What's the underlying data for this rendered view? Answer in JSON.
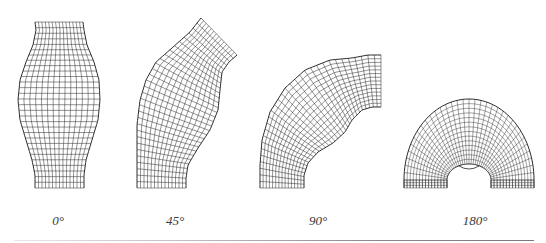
{
  "figure": {
    "stroke_color": "#2a2a2a",
    "panels": [
      {
        "id": "angle-0",
        "label": "0°",
        "label_x": 58,
        "type": "straight",
        "rows": 30,
        "cols": 14,
        "left": [
          [
            35,
            22
          ],
          [
            36,
            30
          ],
          [
            33,
            45
          ],
          [
            26,
            62
          ],
          [
            20,
            80
          ],
          [
            18,
            100
          ],
          [
            20,
            120
          ],
          [
            26,
            140
          ],
          [
            32,
            160
          ],
          [
            35,
            175
          ],
          [
            35,
            188
          ]
        ],
        "right": [
          [
            83,
            22
          ],
          [
            84,
            30
          ],
          [
            87,
            45
          ],
          [
            94,
            62
          ],
          [
            99,
            80
          ],
          [
            100,
            100
          ],
          [
            98,
            120
          ],
          [
            92,
            140
          ],
          [
            86,
            160
          ],
          [
            84,
            175
          ],
          [
            84,
            188
          ]
        ]
      },
      {
        "id": "angle-45",
        "label": "45°",
        "label_x": 175,
        "type": "straight",
        "rows": 30,
        "cols": 14,
        "left": [
          [
            201,
            18
          ],
          [
            190,
            32
          ],
          [
            172,
            48
          ],
          [
            156,
            62
          ],
          [
            146,
            80
          ],
          [
            140,
            100
          ],
          [
            137,
            125
          ],
          [
            137,
            150
          ],
          [
            137,
            170
          ],
          [
            137,
            188
          ]
        ],
        "right": [
          [
            237,
            55
          ],
          [
            229,
            62
          ],
          [
            222,
            72
          ],
          [
            220,
            90
          ],
          [
            218,
            110
          ],
          [
            210,
            130
          ],
          [
            198,
            148
          ],
          [
            188,
            165
          ],
          [
            186,
            178
          ],
          [
            186,
            188
          ]
        ]
      },
      {
        "id": "angle-90",
        "label": "90°",
        "label_x": 318,
        "type": "straight",
        "rows": 32,
        "cols": 14,
        "left": [
          [
            260,
            188
          ],
          [
            260,
            165
          ],
          [
            262,
            140
          ],
          [
            270,
            112
          ],
          [
            285,
            88
          ],
          [
            305,
            70
          ],
          [
            330,
            60
          ],
          [
            352,
            58
          ],
          [
            368,
            55
          ],
          [
            381,
            55
          ]
        ],
        "right": [
          [
            304,
            188
          ],
          [
            304,
            175
          ],
          [
            308,
            163
          ],
          [
            318,
            152
          ],
          [
            333,
            143
          ],
          [
            345,
            132
          ],
          [
            352,
            120
          ],
          [
            362,
            110
          ],
          [
            372,
            107
          ],
          [
            381,
            107
          ]
        ]
      },
      {
        "id": "angle-180",
        "label": "180°",
        "label_x": 475,
        "type": "annulus",
        "cx": 469,
        "base_y": 188,
        "r_outer_x": 65,
        "r_outer_y": 81,
        "r_inner_x": 22,
        "r_inner_y": 16,
        "radial_lines": 34,
        "rings": 14,
        "base_rows": 3
      }
    ],
    "rule": {
      "y": 240,
      "from_x": 14,
      "to_x": 534
    }
  }
}
